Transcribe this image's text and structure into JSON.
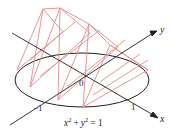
{
  "diagram": {
    "colors": {
      "axis": "#231f20",
      "disk_outline": "#231f20",
      "cross_sections": "#e8898a"
    },
    "axes": {
      "x_label": "x",
      "y_label": "y"
    },
    "ticks": {
      "origin": "0",
      "neg_one": "−1",
      "pos_one": "1"
    },
    "equation": {
      "base_x": "x",
      "exp_x": "2",
      "plus": "+",
      "base_y": "y",
      "exp_y": "2",
      "equals_rhs": "= 1"
    }
  }
}
